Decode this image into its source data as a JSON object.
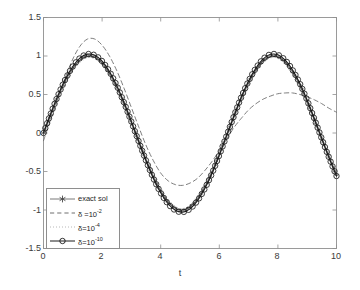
{
  "chart_data": {
    "type": "line",
    "title": "",
    "xlabel": "t",
    "ylabel": "",
    "xlim": [
      0,
      10
    ],
    "ylim": [
      -1.5,
      1.5
    ],
    "xticks": [
      "0",
      "2",
      "4",
      "6",
      "8",
      "10"
    ],
    "xtick_values": [
      0,
      2,
      4,
      6,
      8,
      10
    ],
    "yticks": [
      "1.5",
      "1",
      "0.5",
      "0",
      "-0.5",
      "-1",
      "-1.5"
    ],
    "ytick_values": [
      1.5,
      1,
      0.5,
      0,
      -0.5,
      -1,
      -1.5
    ],
    "grid": false,
    "legend_position": "lower left",
    "series": [
      {
        "name": "exact sol",
        "style": "solid-asterisk",
        "color": "#4a4a4a",
        "x": [
          0,
          0.25,
          0.5,
          0.75,
          1,
          1.25,
          1.5,
          1.75,
          2,
          2.25,
          2.5,
          2.75,
          3,
          3.25,
          3.5,
          3.75,
          4,
          4.25,
          4.5,
          4.75,
          5,
          5.25,
          5.5,
          5.75,
          6,
          6.25,
          6.5,
          6.75,
          7,
          7.25,
          7.5,
          7.75,
          8,
          8.25,
          8.5,
          8.75,
          9,
          9.25,
          9.5,
          9.75,
          10
        ],
        "y": [
          0,
          0.247,
          0.479,
          0.682,
          0.841,
          0.949,
          0.997,
          0.984,
          0.909,
          0.778,
          0.599,
          0.382,
          0.141,
          -0.108,
          -0.351,
          -0.572,
          -0.757,
          -0.895,
          -0.978,
          -1.0,
          -0.959,
          -0.858,
          -0.706,
          -0.512,
          -0.279,
          -0.033,
          0.215,
          0.454,
          0.657,
          0.82,
          0.938,
          0.995,
          0.989,
          0.921,
          0.798,
          0.625,
          0.412,
          0.172,
          -0.075,
          -0.317,
          -0.544
        ]
      },
      {
        "name": "δ =10⁻²",
        "label_base": "δ =10",
        "label_exp": "-2",
        "style": "dashed",
        "color": "#6e6e6e",
        "x": [
          0,
          0.25,
          0.5,
          0.75,
          1,
          1.25,
          1.5,
          1.75,
          2,
          2.25,
          2.5,
          2.75,
          3,
          3.25,
          3.5,
          3.75,
          4,
          4.25,
          4.5,
          4.75,
          5,
          5.25,
          5.5,
          5.75,
          6,
          6.25,
          6.5,
          6.75,
          7,
          7.25,
          7.5,
          7.75,
          8,
          8.25,
          8.5,
          8.75,
          9,
          9.25,
          9.5,
          9.75,
          10
        ],
        "y": [
          -0.1,
          0.18,
          0.46,
          0.72,
          0.96,
          1.13,
          1.22,
          1.22,
          1.14,
          1.0,
          0.81,
          0.58,
          0.33,
          0.08,
          -0.16,
          -0.36,
          -0.52,
          -0.62,
          -0.67,
          -0.68,
          -0.65,
          -0.59,
          -0.49,
          -0.37,
          -0.23,
          -0.08,
          0.07,
          0.19,
          0.3,
          0.38,
          0.44,
          0.48,
          0.51,
          0.52,
          0.52,
          0.5,
          0.47,
          0.43,
          0.38,
          0.32,
          0.27
        ]
      },
      {
        "name": "δ=10⁻⁴",
        "label_base": "δ=10",
        "label_exp": "-4",
        "style": "dotted",
        "color": "#9b9b9b",
        "x": [
          0,
          0.25,
          0.5,
          0.75,
          1,
          1.25,
          1.5,
          1.75,
          2,
          2.25,
          2.5,
          2.75,
          3,
          3.25,
          3.5,
          3.75,
          4,
          4.25,
          4.5,
          4.75,
          5,
          5.25,
          5.5,
          5.75,
          6,
          6.25,
          6.5,
          6.75,
          7,
          7.25,
          7.5,
          7.75,
          8,
          8.25,
          8.5,
          8.75,
          9,
          9.25,
          9.5,
          9.75,
          10
        ],
        "y": [
          0,
          0.252,
          0.488,
          0.694,
          0.857,
          0.966,
          1.014,
          1.0,
          0.924,
          0.79,
          0.608,
          0.388,
          0.143,
          -0.11,
          -0.357,
          -0.581,
          -0.769,
          -0.909,
          -0.993,
          -1.016,
          -0.974,
          -0.872,
          -0.717,
          -0.52,
          -0.284,
          -0.034,
          0.218,
          0.461,
          0.668,
          0.834,
          0.953,
          1.011,
          1.005,
          0.936,
          0.811,
          0.635,
          0.419,
          0.175,
          -0.076,
          -0.322,
          -0.553
        ]
      },
      {
        "name": "δ=10⁻¹⁰",
        "label_base": "δ=10",
        "label_exp": "-10",
        "style": "solid-circle",
        "color": "#1a1a1a",
        "x": [
          0,
          0.25,
          0.5,
          0.75,
          1,
          1.25,
          1.5,
          1.75,
          2,
          2.25,
          2.5,
          2.75,
          3,
          3.25,
          3.5,
          3.75,
          4,
          4.25,
          4.5,
          4.75,
          5,
          5.25,
          5.5,
          5.75,
          6,
          6.25,
          6.5,
          6.75,
          7,
          7.25,
          7.5,
          7.75,
          8,
          8.25,
          8.5,
          8.75,
          9,
          9.25,
          9.5,
          9.75,
          10
        ],
        "y": [
          0,
          0.254,
          0.492,
          0.7,
          0.864,
          0.975,
          1.024,
          1.01,
          0.933,
          0.798,
          0.615,
          0.392,
          0.145,
          -0.111,
          -0.36,
          -0.587,
          -0.777,
          -0.919,
          -1.004,
          -1.027,
          -0.985,
          -0.881,
          -0.725,
          -0.526,
          -0.287,
          -0.034,
          0.221,
          0.466,
          0.675,
          0.842,
          0.963,
          1.022,
          1.015,
          0.946,
          0.819,
          0.642,
          0.423,
          0.177,
          -0.077,
          -0.325,
          -0.559
        ]
      }
    ]
  },
  "legend": {
    "entries": [
      {
        "label": "exact sol"
      },
      {
        "label_base": "δ =10",
        "label_exp": "-2"
      },
      {
        "label_base": "δ=10",
        "label_exp": "-4"
      },
      {
        "label_base": "δ=10",
        "label_exp": "-10"
      }
    ]
  }
}
